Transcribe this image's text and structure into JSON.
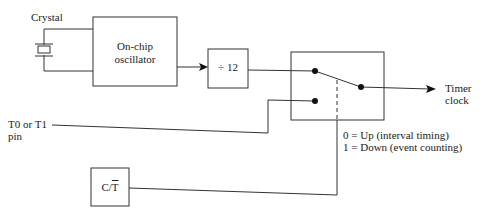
{
  "diagram": {
    "crystal_label": "Crystal",
    "oscillator_label_line1": "On-chip",
    "oscillator_label_line2": "oscillator",
    "divider_label": "÷ 12",
    "pin_label_line1": "T0 or T1",
    "pin_label_line2": "pin",
    "ct_label_c": "C/",
    "ct_label_t": "T",
    "output_label_line1": "Timer",
    "output_label_line2": "clock",
    "mode_line1": "0 = Up (interval timing)",
    "mode_line2": "1 = Down (event counting)"
  },
  "colors": {
    "stroke": "#333333",
    "text": "#222222",
    "background": "#ffffff"
  }
}
